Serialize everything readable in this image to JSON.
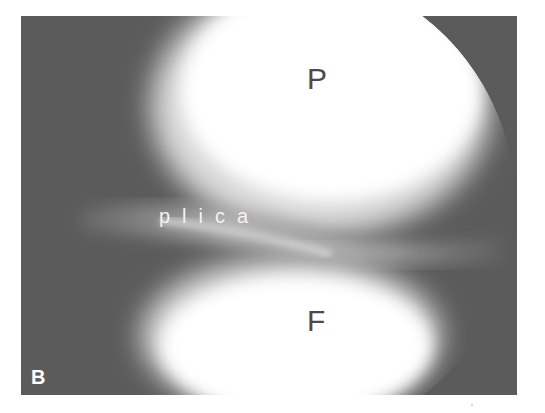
{
  "figure": {
    "panel_label": "B",
    "structures": {
      "upper": "P",
      "lower": "F",
      "band": "plica"
    },
    "colors": {
      "background": "#5b5b5b",
      "bright_tissue": "#ffffff",
      "plica_band": "#a8a8a8",
      "upper_letter": "#4a4a4a",
      "lower_letter": "#4a4a4a",
      "plica_label": "#f2f2f2",
      "panel_label": "#ffffff"
    }
  }
}
